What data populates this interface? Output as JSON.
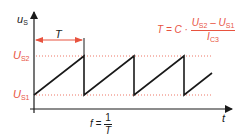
{
  "colors": {
    "axis": "#1a1a1a",
    "waveform": "#1a1a1a",
    "accent": "#e8533f",
    "guide": "#e8533f"
  },
  "axes": {
    "y_label": "u",
    "y_label_sub": "S",
    "x_label": "t"
  },
  "levels": {
    "upper": {
      "label": "U",
      "sub": "S2"
    },
    "lower": {
      "label": "U",
      "sub": "S1"
    }
  },
  "period": {
    "label": "T"
  },
  "formula_period": {
    "lhs": "T = C ·",
    "num_a": "U",
    "num_a_sub": "S2",
    "minus": " – ",
    "num_b": "U",
    "num_b_sub": "S1",
    "den": "I",
    "den_sub": "C3"
  },
  "formula_frequency": {
    "lhs": "f =",
    "num": "1",
    "den": "T"
  }
}
